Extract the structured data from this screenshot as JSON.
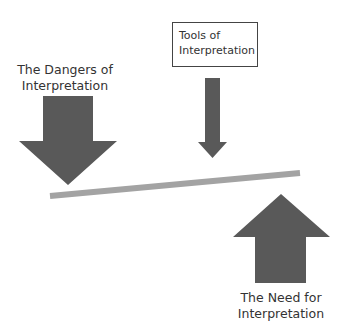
{
  "diagram": {
    "type": "balance-scale metaphor",
    "labels": {
      "tools": [
        "Tools of",
        "Interpretation"
      ],
      "dangers": [
        "The Dangers of",
        "Interpretation"
      ],
      "need": [
        "The Need for",
        "Interpretation"
      ]
    },
    "colors": {
      "arrow": "#595959",
      "beam": "#a3a3a3",
      "text": "#333333",
      "box_border": "#444444"
    },
    "shapes": {
      "tools_arrow": {
        "direction": "down",
        "size": "small"
      },
      "dangers_arrow": {
        "direction": "down",
        "size": "large"
      },
      "need_arrow": {
        "direction": "up",
        "size": "large"
      },
      "beam": {
        "tilt": "left side lower"
      }
    }
  }
}
